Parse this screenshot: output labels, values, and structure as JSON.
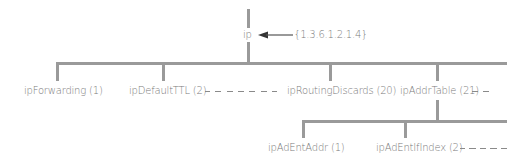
{
  "root": {
    "label": "ip",
    "oid": "{1.3.6.1.2.1.4}"
  },
  "level1": [
    {
      "label": "ipForwarding (1)"
    },
    {
      "label": "ipDefaultTTL (2)"
    },
    {
      "label": "ipRoutingDiscards (20)"
    },
    {
      "label": "ipAddrTable (21)"
    }
  ],
  "level2": [
    {
      "label": "ipAdEntAddr (1)"
    },
    {
      "label": "ipAdEntIfIndex (2)"
    }
  ],
  "colors": {
    "line": "#9a9a9a",
    "text": "#7a7a7a",
    "arrow": "#333333"
  }
}
